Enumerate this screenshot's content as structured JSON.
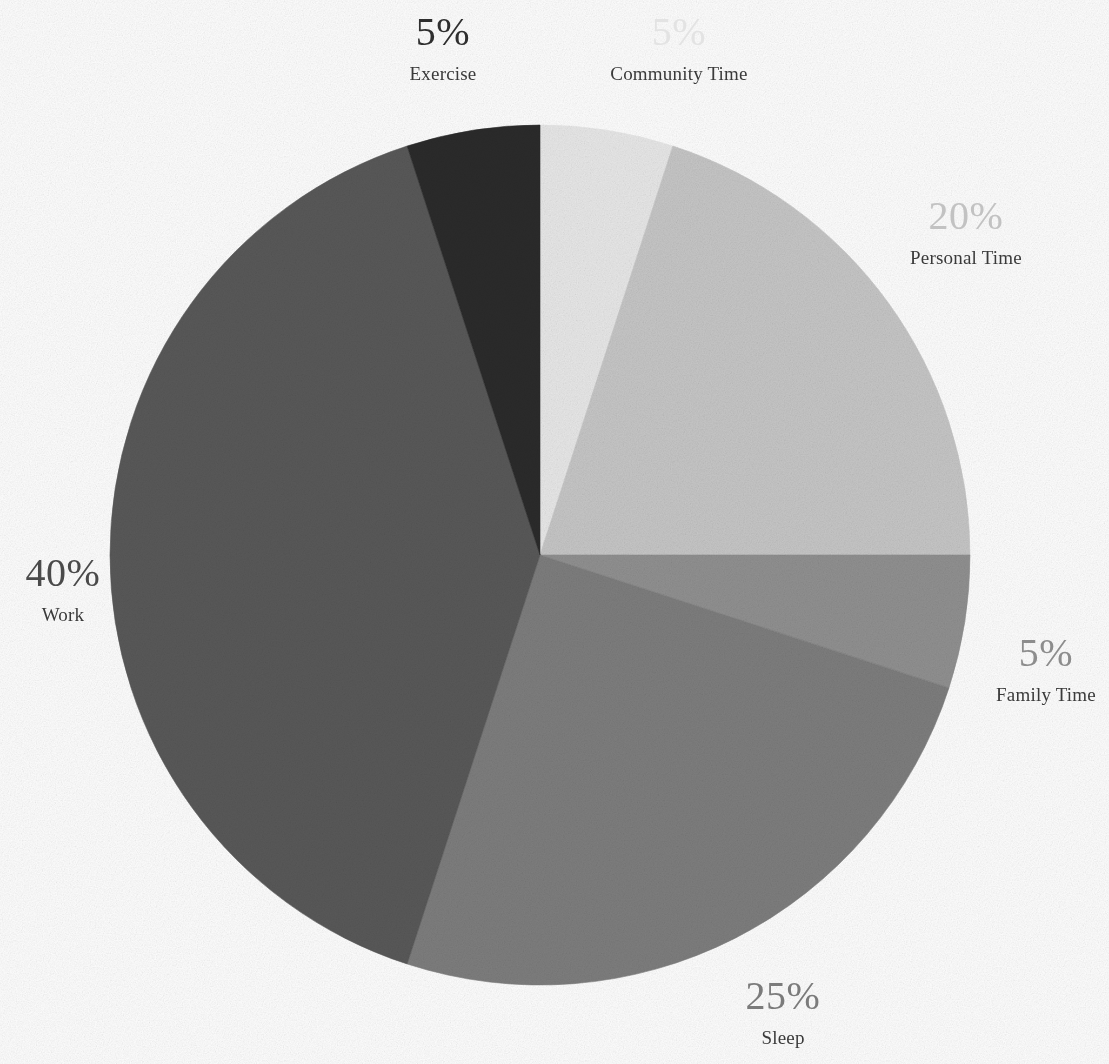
{
  "chart_data": {
    "type": "pie",
    "title": "",
    "subtitle": "",
    "xlabel": "",
    "ylabel": "",
    "legend_position": "none",
    "grid": false,
    "start_angle_deg": 0,
    "direction": "clockwise",
    "units": "percent",
    "categories": [
      "Community Time",
      "Personal Time",
      "Family Time",
      "Sleep",
      "Work",
      "Exercise"
    ],
    "values": [
      5,
      20,
      5,
      25,
      40,
      5
    ],
    "labels": [
      "5%",
      "20%",
      "5%",
      "25%",
      "40%",
      "5%"
    ],
    "colors": [
      "#e9e9e9",
      "#c7c7c7",
      "#919191",
      "#7e7e7e",
      "#595959",
      "#2b2b2b"
    ],
    "slices": [
      {
        "category": "Community Time",
        "value": 5,
        "label": "5%",
        "color": "#e9e9e9",
        "label_color": "#e3e3e3",
        "start_deg": 0,
        "end_deg": 18
      },
      {
        "category": "Personal Time",
        "value": 20,
        "label": "20%",
        "color": "#c7c7c7",
        "label_color": "#c2c2c2",
        "start_deg": 18,
        "end_deg": 90
      },
      {
        "category": "Family Time",
        "value": 5,
        "label": "5%",
        "color": "#919191",
        "label_color": "#8d8d8d",
        "start_deg": 90,
        "end_deg": 108
      },
      {
        "category": "Sleep",
        "value": 25,
        "label": "25%",
        "color": "#7e7e7e",
        "label_color": "#7b7b7b",
        "start_deg": 108,
        "end_deg": 198
      },
      {
        "category": "Work",
        "value": 40,
        "label": "40%",
        "color": "#595959",
        "label_color": "#4a4a4a",
        "start_deg": 198,
        "end_deg": 342
      },
      {
        "category": "Exercise",
        "value": 5,
        "label": "5%",
        "color": "#2b2b2b",
        "label_color": "#2e2e2e",
        "start_deg": 342,
        "end_deg": 360
      }
    ],
    "geometry": {
      "center_x": 540,
      "center_y": 555,
      "radius": 430
    },
    "background_color": "#ffffff",
    "category_label_color": "#3a3a3a"
  }
}
